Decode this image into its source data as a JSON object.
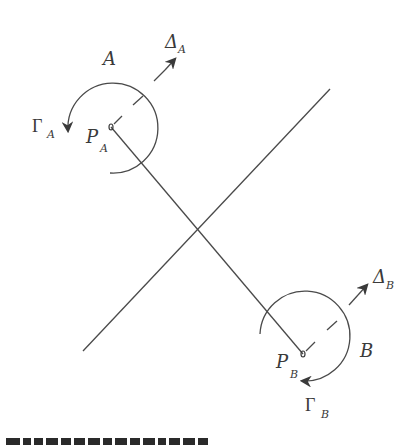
{
  "diagram": {
    "colors": {
      "line": "#4a4a4a",
      "text": "#3a3a3a",
      "background": "#ffffff"
    },
    "labels": {
      "region_a": "A",
      "region_b": "B",
      "point_a": "P",
      "point_a_sub": "A",
      "point_b": "P",
      "point_b_sub": "B",
      "gamma_a": "Γ",
      "gamma_a_sub": "A",
      "gamma_b": "Γ",
      "gamma_b_sub": "B",
      "delta_a": "Δ",
      "delta_a_sub": "A",
      "delta_b": "Δ",
      "delta_b_sub": "B"
    },
    "geometry": {
      "point_a": [
        111,
        127
      ],
      "point_b": [
        303,
        354
      ],
      "perpendicular_line": [
        [
          83,
          351
        ],
        [
          330,
          89
        ]
      ],
      "intersection": [
        203,
        224
      ]
    }
  },
  "caption": {
    "visible": "partially cut off at bottom edge; text not legible"
  }
}
